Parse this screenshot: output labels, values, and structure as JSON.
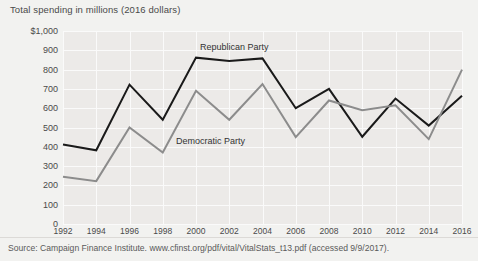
{
  "chart_data": {
    "type": "line",
    "title": "Total spending in millions (2016 dollars)",
    "xlabel": "",
    "ylabel": "Total spending in millions (2016 dollars)",
    "ylim": [
      0,
      1000
    ],
    "ytick_step": 100,
    "grid": true,
    "legend_position": "inline-annotations",
    "categories": [
      1992,
      1994,
      1996,
      1998,
      2000,
      2002,
      2004,
      2006,
      2008,
      2010,
      2012,
      2014,
      2016
    ],
    "x_tick_labels": [
      "1992",
      "1994",
      "1996",
      "1998",
      "2000",
      "2002",
      "2004",
      "2006",
      "2008",
      "2010",
      "2012",
      "2014",
      "2016"
    ],
    "y_tick_labels": [
      "$1,000",
      "900",
      "800",
      "700",
      "600",
      "500",
      "400",
      "300",
      "200",
      "100",
      "0"
    ],
    "y_tick_values": [
      1000,
      900,
      800,
      700,
      600,
      500,
      400,
      300,
      200,
      100,
      0
    ],
    "series": [
      {
        "name": "Republican Party",
        "color": "#1a1a1a",
        "values": [
          412,
          382,
          722,
          540,
          862,
          845,
          858,
          600,
          700,
          452,
          650,
          510,
          665
        ]
      },
      {
        "name": "Democratic Party",
        "color": "#8c8c8c",
        "values": [
          245,
          222,
          500,
          370,
          690,
          540,
          725,
          450,
          640,
          590,
          615,
          440,
          800
        ]
      }
    ],
    "annotations": [
      {
        "text": "Republican Party",
        "series": "Republican Party"
      },
      {
        "text": "Democratic Party",
        "series": "Democratic Party"
      }
    ]
  },
  "footer": {
    "source": "Source: Campaign Finance Institute. www.cfinst.org/pdf/vital/VitalStats_t13.pdf (accessed 9/9/2017)."
  },
  "colors": {
    "page_background": "#f2f2f0",
    "plot_background": "#eceae8",
    "gridline": "#fafafa",
    "republican": "#1a1a1a",
    "democratic": "#8c8c8c",
    "text": "#4a4a4a"
  }
}
